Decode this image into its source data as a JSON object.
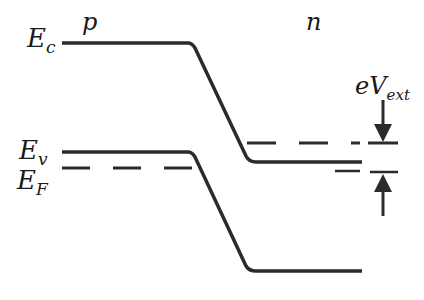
{
  "diagram": {
    "type": "band-diagram",
    "labels": {
      "conduction_band": {
        "main": "E",
        "sub": "c"
      },
      "valence_band": {
        "main": "E",
        "sub": "v"
      },
      "fermi_level": {
        "main": "E",
        "sub": "F"
      },
      "p_region": "p",
      "n_region": "n",
      "external_voltage": {
        "main": "eV",
        "sub": "ext"
      }
    },
    "colors": {
      "line": "#2b2b2b",
      "background": "#ffffff"
    }
  }
}
